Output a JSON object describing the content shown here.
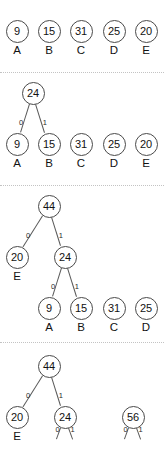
{
  "figure": {
    "node_shape": "circle",
    "edge_label_values": [
      "0",
      "1"
    ],
    "colors": {
      "node_stroke": "#4a4a4a",
      "node_fill": "#ffffff",
      "edge_stroke": "#5a5a5a",
      "divider": "#c3c3c3",
      "text": "#121212"
    }
  },
  "panels": [
    {
      "id": "step-1",
      "nodes": [
        {
          "id": "p1-n9",
          "value": "9",
          "leaf_label": "A",
          "x": 17,
          "y": 31
        },
        {
          "id": "p1-n15",
          "value": "15",
          "leaf_label": "B",
          "x": 49,
          "y": 31
        },
        {
          "id": "p1-n31",
          "value": "31",
          "leaf_label": "C",
          "x": 81,
          "y": 31
        },
        {
          "id": "p1-n25",
          "value": "25",
          "leaf_label": "D",
          "x": 114,
          "y": 31
        },
        {
          "id": "p1-n20",
          "value": "20",
          "leaf_label": "E",
          "x": 146,
          "y": 31
        }
      ],
      "edges": []
    },
    {
      "id": "step-2",
      "nodes": [
        {
          "id": "p2-n24",
          "value": "24",
          "leaf_label": "",
          "x": 33,
          "y": 93
        },
        {
          "id": "p2-n9",
          "value": "9",
          "leaf_label": "A",
          "x": 17,
          "y": 144
        },
        {
          "id": "p2-n15",
          "value": "15",
          "leaf_label": "B",
          "x": 49,
          "y": 144
        },
        {
          "id": "p2-n31",
          "value": "31",
          "leaf_label": "C",
          "x": 81,
          "y": 144
        },
        {
          "id": "p2-n25",
          "value": "25",
          "leaf_label": "D",
          "x": 114,
          "y": 144
        },
        {
          "id": "p2-n20",
          "value": "20",
          "leaf_label": "E",
          "x": 146,
          "y": 144
        }
      ],
      "edges": [
        {
          "from": "p2-n24",
          "to": "p2-n9",
          "label": "0"
        },
        {
          "from": "p2-n24",
          "to": "p2-n15",
          "label": "1"
        }
      ]
    },
    {
      "id": "step-3",
      "nodes": [
        {
          "id": "p3-n44",
          "value": "44",
          "leaf_label": "",
          "x": 49,
          "y": 206
        },
        {
          "id": "p3-n20",
          "value": "20",
          "leaf_label": "E",
          "x": 17,
          "y": 257
        },
        {
          "id": "p3-n24",
          "value": "24",
          "leaf_label": "",
          "x": 65,
          "y": 257
        },
        {
          "id": "p3-n9",
          "value": "9",
          "leaf_label": "A",
          "x": 49,
          "y": 308
        },
        {
          "id": "p3-n15",
          "value": "15",
          "leaf_label": "B",
          "x": 81,
          "y": 308
        },
        {
          "id": "p3-n31",
          "value": "31",
          "leaf_label": "C",
          "x": 114,
          "y": 308
        },
        {
          "id": "p3-n25",
          "value": "25",
          "leaf_label": "D",
          "x": 146,
          "y": 308
        }
      ],
      "edges": [
        {
          "from": "p3-n44",
          "to": "p3-n20",
          "label": "0"
        },
        {
          "from": "p3-n44",
          "to": "p3-n24",
          "label": "1"
        },
        {
          "from": "p3-n24",
          "to": "p3-n9",
          "label": "0"
        },
        {
          "from": "p3-n24",
          "to": "p3-n15",
          "label": "1"
        }
      ]
    },
    {
      "id": "step-4",
      "nodes": [
        {
          "id": "p4-n44",
          "value": "44",
          "leaf_label": "",
          "x": 49,
          "y": 366
        },
        {
          "id": "p4-n20",
          "value": "20",
          "leaf_label": "E",
          "x": 17,
          "y": 417
        },
        {
          "id": "p4-n24",
          "value": "24",
          "leaf_label": "",
          "x": 65,
          "y": 417
        },
        {
          "id": "p4-n56",
          "value": "56",
          "leaf_label": "",
          "x": 133,
          "y": 417
        }
      ],
      "edges": [
        {
          "from": "p4-n44",
          "to": "p4-n20",
          "label": "0"
        },
        {
          "from": "p4-n44",
          "to": "p4-n24",
          "label": "1"
        },
        {
          "from": "p4-n24",
          "to": null,
          "label": "0",
          "stub": true,
          "dx": -8,
          "dy": 22
        },
        {
          "from": "p4-n24",
          "to": null,
          "label": "1",
          "stub": true,
          "dx": 8,
          "dy": 22
        },
        {
          "from": "p4-n56",
          "to": null,
          "label": "0",
          "stub": true,
          "dx": -8,
          "dy": 22
        },
        {
          "from": "p4-n56",
          "to": null,
          "label": "1",
          "stub": true,
          "dx": 8,
          "dy": 22
        }
      ]
    }
  ],
  "dividers": [
    72,
    185,
    342
  ]
}
